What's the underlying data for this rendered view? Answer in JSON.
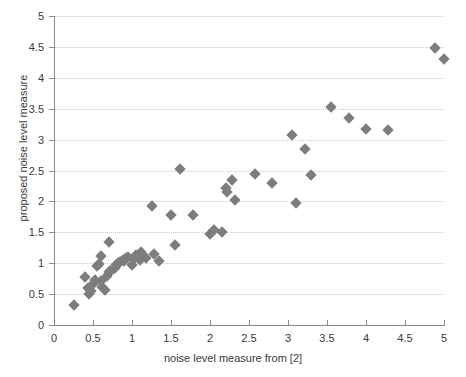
{
  "chart_data": {
    "type": "scatter",
    "title": "",
    "xlabel": "noise level measure from [2]",
    "ylabel": "proposed noise level measure",
    "xlim": [
      0,
      5
    ],
    "ylim": [
      0,
      5
    ],
    "xticks": [
      "0",
      "0.5",
      "1",
      "1.5",
      "2",
      "2.5",
      "3",
      "3.5",
      "4",
      "4.5",
      "5"
    ],
    "xtick_values": [
      0,
      0.5,
      1,
      1.5,
      2,
      2.5,
      3,
      3.5,
      4,
      4.5,
      5
    ],
    "yticks": [
      "0",
      "0.5",
      "1",
      "1.5",
      "2",
      "2.5",
      "3",
      "3.5",
      "4",
      "4.5",
      "5"
    ],
    "ytick_values": [
      0,
      0.5,
      1,
      1.5,
      2,
      2.5,
      3,
      3.5,
      4,
      4.5,
      5
    ],
    "grid": true,
    "grid_axis": "y",
    "grid_style": "dotted",
    "legend": null,
    "marker_shape": "diamond",
    "marker_color": "#7d7d7d",
    "marker_size_px": 8,
    "points": [
      {
        "x": 0.25,
        "y": 0.33
      },
      {
        "x": 0.4,
        "y": 0.78
      },
      {
        "x": 0.43,
        "y": 0.6
      },
      {
        "x": 0.45,
        "y": 0.5
      },
      {
        "x": 0.48,
        "y": 0.55
      },
      {
        "x": 0.5,
        "y": 0.67
      },
      {
        "x": 0.52,
        "y": 0.73
      },
      {
        "x": 0.55,
        "y": 0.95
      },
      {
        "x": 0.58,
        "y": 0.98
      },
      {
        "x": 0.6,
        "y": 0.72
      },
      {
        "x": 0.62,
        "y": 0.62
      },
      {
        "x": 0.65,
        "y": 0.57
      },
      {
        "x": 0.68,
        "y": 0.8
      },
      {
        "x": 0.7,
        "y": 0.85
      },
      {
        "x": 0.72,
        "y": 0.88
      },
      {
        "x": 0.75,
        "y": 0.9
      },
      {
        "x": 0.78,
        "y": 0.93
      },
      {
        "x": 0.8,
        "y": 0.97
      },
      {
        "x": 0.82,
        "y": 1.0
      },
      {
        "x": 0.85,
        "y": 1.02
      },
      {
        "x": 0.88,
        "y": 1.05
      },
      {
        "x": 0.9,
        "y": 1.04
      },
      {
        "x": 0.92,
        "y": 1.08
      },
      {
        "x": 0.95,
        "y": 1.1
      },
      {
        "x": 0.7,
        "y": 1.35
      },
      {
        "x": 0.6,
        "y": 1.12
      },
      {
        "x": 1.0,
        "y": 0.97
      },
      {
        "x": 1.02,
        "y": 1.07
      },
      {
        "x": 1.05,
        "y": 1.13
      },
      {
        "x": 1.1,
        "y": 1.05
      },
      {
        "x": 1.12,
        "y": 1.18
      },
      {
        "x": 1.18,
        "y": 1.08
      },
      {
        "x": 1.25,
        "y": 1.92
      },
      {
        "x": 1.28,
        "y": 1.15
      },
      {
        "x": 1.35,
        "y": 1.03
      },
      {
        "x": 1.5,
        "y": 1.78
      },
      {
        "x": 1.55,
        "y": 1.3
      },
      {
        "x": 1.62,
        "y": 2.52
      },
      {
        "x": 1.78,
        "y": 1.78
      },
      {
        "x": 2.0,
        "y": 1.48
      },
      {
        "x": 2.05,
        "y": 1.53
      },
      {
        "x": 2.15,
        "y": 1.5
      },
      {
        "x": 2.2,
        "y": 2.22
      },
      {
        "x": 2.22,
        "y": 2.15
      },
      {
        "x": 2.28,
        "y": 2.35
      },
      {
        "x": 2.32,
        "y": 2.03
      },
      {
        "x": 2.58,
        "y": 2.45
      },
      {
        "x": 2.8,
        "y": 2.3
      },
      {
        "x": 3.05,
        "y": 3.07
      },
      {
        "x": 3.1,
        "y": 1.97
      },
      {
        "x": 3.22,
        "y": 2.85
      },
      {
        "x": 3.3,
        "y": 2.42
      },
      {
        "x": 3.55,
        "y": 3.52
      },
      {
        "x": 3.78,
        "y": 3.35
      },
      {
        "x": 4.0,
        "y": 3.17
      },
      {
        "x": 4.28,
        "y": 3.15
      },
      {
        "x": 4.88,
        "y": 4.48
      },
      {
        "x": 5.0,
        "y": 4.3
      }
    ]
  }
}
